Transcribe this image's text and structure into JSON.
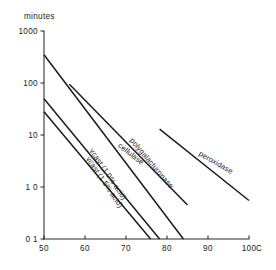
{
  "chart_data": {
    "type": "line",
    "title": "",
    "xlabel": "C",
    "ylabel": "minutes",
    "y_scale": "log",
    "x_scale": "linear",
    "xlim": [
      50,
      100
    ],
    "ylim": [
      0.1,
      1000
    ],
    "grid": false,
    "legend": "inline-labels",
    "x_ticks": [
      "50",
      "60",
      "70",
      "80",
      "90",
      "100"
    ],
    "x_tick_values": [
      50,
      60,
      70,
      80,
      90,
      100
    ],
    "y_ticks": [
      "1000",
      "100",
      "10",
      "1 0",
      "0 1"
    ],
    "y_tick_values": [
      1000,
      100,
      10,
      1.0,
      0.1
    ],
    "series": [
      {
        "name": "vcast (1 5% acid)",
        "label": "vcast (1 5% acid)",
        "points": [
          [
            50,
            28
          ],
          [
            76,
            0.1
          ]
        ],
        "label_angle": 56
      },
      {
        "name": "vcast (1 0% acid)",
        "label": "vcast (1 0% acid)",
        "points": [
          [
            50,
            50
          ],
          [
            78.2,
            0.1
          ]
        ],
        "label_angle": 56
      },
      {
        "name": "cellulase",
        "label": "cellulase",
        "points": [
          [
            50,
            350
          ],
          [
            84,
            0.1
          ]
        ],
        "label_angle": 38
      },
      {
        "name": "polygalacturonase",
        "label": "polygalacturonase",
        "points": [
          [
            56.2,
            95
          ],
          [
            85,
            0.45
          ]
        ],
        "label_angle": 50
      },
      {
        "name": "peroxidase",
        "label": "peroxidase",
        "points": [
          [
            78.2,
            13
          ],
          [
            100,
            0.55
          ]
        ],
        "label_angle": 30
      }
    ]
  },
  "axes": {
    "y_caption": "minutes",
    "x_unit": "C"
  }
}
